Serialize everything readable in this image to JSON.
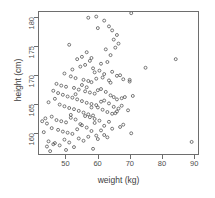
{
  "chart_data": {
    "type": "scatter",
    "title": "",
    "xlabel": "weight (kg)",
    "ylabel": "height (cm)",
    "xlim": [
      41.5,
      91.5
    ],
    "ylim": [
      156.3,
      181.0
    ],
    "xticks": [
      50,
      60,
      70,
      80,
      90
    ],
    "yticks": [
      160,
      165,
      170,
      175,
      180
    ],
    "xtick_labels": [
      "50",
      "60",
      "70",
      "80",
      "90"
    ],
    "ytick_labels": [
      "160",
      "165",
      "170",
      "175",
      "180"
    ],
    "grid": false,
    "legend": null,
    "marker": "open-circle",
    "marker_color": "#555555",
    "marker_size": 3,
    "n_points": 152,
    "series": [
      {
        "name": "subjects",
        "x": [
          57.0,
          59.5,
          62.0,
          70.5,
          63.5,
          64.5,
          66.0,
          65.0,
          66.5,
          60.0,
          51.0,
          56.5,
          62.5,
          58.0,
          64.0,
          53.5,
          55.0,
          57.5,
          61.0,
          63.0,
          65.5,
          52.0,
          54.5,
          56.0,
          58.5,
          59.0,
          60.5,
          62.0,
          64.5,
          67.0,
          49.5,
          51.5,
          53.0,
          55.5,
          57.0,
          58.0,
          59.5,
          61.5,
          63.5,
          66.0,
          68.0,
          75.0,
          84.5,
          47.0,
          48.5,
          50.0,
          52.5,
          54.0,
          56.0,
          57.5,
          59.0,
          60.0,
          61.0,
          62.5,
          64.0,
          65.0,
          67.5,
          70.0,
          71.0,
          46.0,
          47.5,
          49.0,
          50.5,
          52.0,
          53.5,
          55.0,
          56.5,
          58.0,
          59.5,
          61.0,
          62.0,
          63.5,
          65.0,
          66.5,
          68.5,
          44.5,
          46.5,
          48.0,
          49.5,
          51.0,
          52.5,
          54.0,
          55.5,
          57.0,
          58.5,
          60.0,
          61.5,
          63.0,
          64.5,
          66.0,
          67.5,
          69.5,
          43.5,
          45.5,
          47.0,
          48.5,
          50.0,
          51.5,
          53.0,
          54.5,
          56.0,
          57.5,
          59.0,
          60.5,
          62.0,
          63.5,
          65.5,
          67.0,
          42.5,
          44.0,
          45.5,
          47.5,
          49.0,
          50.5,
          52.0,
          53.5,
          55.0,
          56.5,
          58.0,
          59.5,
          61.0,
          63.0,
          64.5,
          66.0,
          68.0,
          70.5,
          43.0,
          44.5,
          46.0,
          48.0,
          49.5,
          51.0,
          52.5,
          54.0,
          55.5,
          57.0,
          58.5,
          60.0,
          62.0,
          50.0,
          51.5,
          53.0,
          55.0,
          56.5,
          58.0,
          59.0,
          44.0,
          45.0,
          46.5,
          89.5,
          64.0,
          70.0
        ],
        "y": [
          180.0,
          180.2,
          179.5,
          180.8,
          178.5,
          177.8,
          177.0,
          176.2,
          175.5,
          178.2,
          175.3,
          174.0,
          174.5,
          173.0,
          173.5,
          172.8,
          173.2,
          172.5,
          172.0,
          172.3,
          174.8,
          171.0,
          171.5,
          171.8,
          171.2,
          170.5,
          170.8,
          170.2,
          170.6,
          170.0,
          170.3,
          169.8,
          169.5,
          169.2,
          169.0,
          168.8,
          169.4,
          169.6,
          169.1,
          169.9,
          169.3,
          171.3,
          172.8,
          168.5,
          168.2,
          168.0,
          167.8,
          167.5,
          167.2,
          167.0,
          166.8,
          167.4,
          167.6,
          167.1,
          166.5,
          166.2,
          166.0,
          169.2,
          166.4,
          167.3,
          166.9,
          166.6,
          166.3,
          166.1,
          165.8,
          165.5,
          165.2,
          165.0,
          164.8,
          165.4,
          165.6,
          165.1,
          164.5,
          164.2,
          166.2,
          165.3,
          165.9,
          164.9,
          164.6,
          164.3,
          164.1,
          163.8,
          163.5,
          163.2,
          163.0,
          164.4,
          164.0,
          163.6,
          163.3,
          165.8,
          164.7,
          163.9,
          162.5,
          162.8,
          162.2,
          162.0,
          161.8,
          162.6,
          162.3,
          161.5,
          162.9,
          162.7,
          162.4,
          162.1,
          161.2,
          161.9,
          163.4,
          161.0,
          162.0,
          161.6,
          160.8,
          160.5,
          160.2,
          160.0,
          159.8,
          160.6,
          161.3,
          160.9,
          160.3,
          159.5,
          160.4,
          159.2,
          160.7,
          163.7,
          161.4,
          159.9,
          160.1,
          158.5,
          158.0,
          157.8,
          158.8,
          158.3,
          157.5,
          159.0,
          158.6,
          159.3,
          157.2,
          158.9,
          159.6,
          157.0,
          163.1,
          166.7,
          168.3,
          167.9,
          164.4,
          161.7,
          157.6,
          156.8,
          158.2,
          158.4,
          168.7,
          168.9
        ]
      }
    ]
  }
}
